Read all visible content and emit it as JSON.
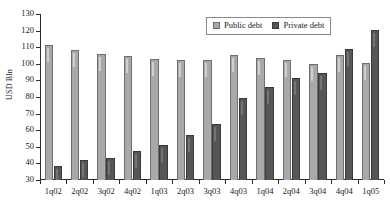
{
  "chart_data": {
    "type": "bar",
    "title": "",
    "xlabel": "",
    "ylabel": "USD Bln",
    "ylim": [
      30,
      130
    ],
    "ytick_step": 10,
    "yticks": [
      30,
      40,
      50,
      60,
      70,
      80,
      90,
      100,
      110,
      120,
      130
    ],
    "grid": false,
    "legend_position": "top-right",
    "categories": [
      "1q02",
      "2q02",
      "3q02",
      "4q02",
      "1q03",
      "2q03",
      "3q03",
      "4q03",
      "1q04",
      "2q04",
      "3q04",
      "4q04",
      "1q05"
    ],
    "series": [
      {
        "name": "Public debt",
        "color": "#a9a9a9",
        "values": [
          111.2,
          108.5,
          106.1,
          105.0,
          103.0,
          102.4,
          102.3,
          105.6,
          103.8,
          102.2,
          100.0,
          105.2,
          100.5
        ]
      },
      {
        "name": "Private debt",
        "color": "#565656",
        "values": [
          38.6,
          42.3,
          43.1,
          47.7,
          51.2,
          57.1,
          63.6,
          79.6,
          86.0,
          91.7,
          94.7,
          109.2,
          120.3
        ]
      }
    ]
  },
  "legend": {
    "entries": [
      {
        "label": "Public debt",
        "swatch": "public"
      },
      {
        "label": "Private debt",
        "swatch": "private"
      }
    ]
  }
}
